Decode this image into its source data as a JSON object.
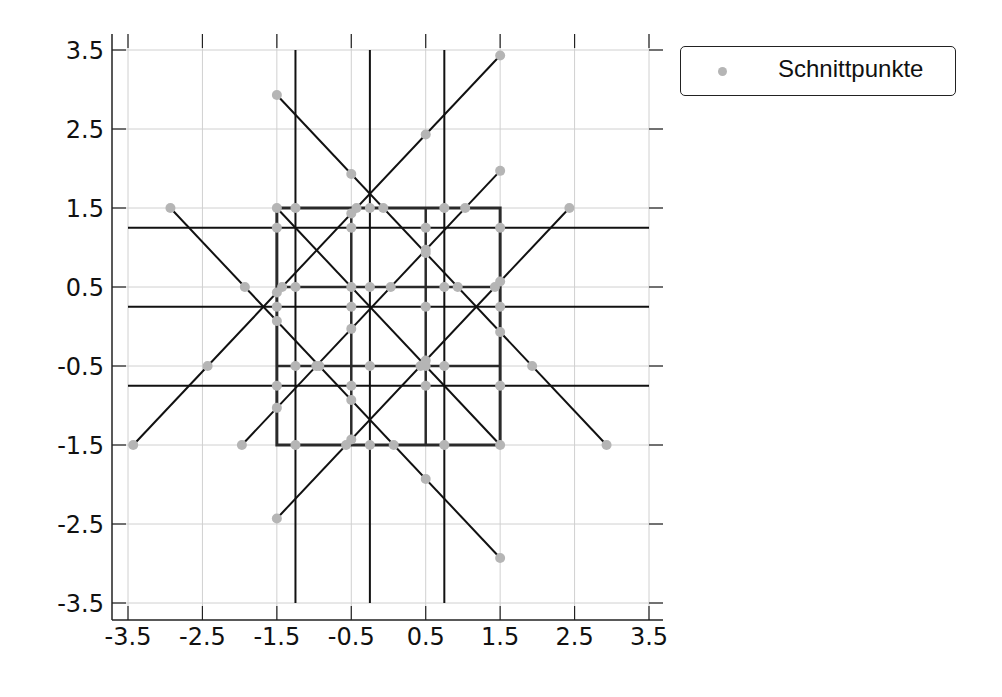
{
  "chart_data": {
    "type": "line+scatter",
    "title": "",
    "xlabel": "",
    "ylabel": "",
    "xlim": [
      -3.7,
      3.7
    ],
    "ylim": [
      -3.7,
      3.7
    ],
    "grid": true,
    "legend_position": "outside upper right",
    "xticks": [
      -3.5,
      -2.5,
      -1.5,
      -0.5,
      0.5,
      1.5,
      2.5,
      3.5
    ],
    "yticks": [
      -3.5,
      -2.5,
      -1.5,
      -0.5,
      0.5,
      1.5,
      2.5,
      3.5
    ],
    "xtick_labels": [
      "-3.5",
      "-2.5",
      "-1.5",
      "-0.5",
      "0.5",
      "1.5",
      "2.5",
      "3.5"
    ],
    "ytick_labels": [
      "-3.5",
      "-2.5",
      "-1.5",
      "-0.5",
      "0.5",
      "1.5",
      "2.5",
      "3.5"
    ],
    "colors": {
      "line": "#111111",
      "square": "#2a2a2a",
      "point": "#b5b5b5",
      "grid": "#d0d0d0"
    },
    "lines": {
      "horizontal": [
        {
          "y": 1.25,
          "x": [
            -3.5,
            3.5
          ]
        },
        {
          "y": 0.25,
          "x": [
            -3.5,
            3.5
          ]
        },
        {
          "y": -0.75,
          "x": [
            -3.5,
            3.5
          ]
        }
      ],
      "vertical": [
        {
          "x": -1.25,
          "y": [
            -3.5,
            3.5
          ]
        },
        {
          "x": -0.25,
          "y": [
            -3.5,
            3.5
          ]
        },
        {
          "x": 0.75,
          "y": [
            -3.5,
            3.5
          ]
        }
      ],
      "square_grid": {
        "outer": [
          -1.5,
          1.5
        ],
        "inner_x": [
          -0.5,
          0.5
        ],
        "inner_y": [
          -0.5,
          0.5
        ]
      },
      "diagonals": [
        {
          "from": [
            -3.43,
            -1.5
          ],
          "to": [
            1.5,
            3.43
          ]
        },
        {
          "from": [
            -1.97,
            -1.5
          ],
          "to": [
            1.5,
            1.97
          ]
        },
        {
          "from": [
            -1.5,
            -2.43
          ],
          "to": [
            2.43,
            1.5
          ]
        },
        {
          "from": [
            -1.5,
            2.93
          ],
          "to": [
            2.93,
            -1.5
          ]
        },
        {
          "from": [
            -1.5,
            1.5
          ],
          "to": [
            1.5,
            -1.5
          ]
        },
        {
          "from": [
            -2.93,
            1.5
          ],
          "to": [
            1.5,
            -2.93
          ]
        }
      ]
    },
    "series": [
      {
        "name": "Schnittpunkte",
        "type": "scatter",
        "points": [
          [
            -3.43,
            -1.5
          ],
          [
            -1.97,
            -1.5
          ],
          [
            -1.25,
            -1.5
          ],
          [
            -0.57,
            -1.5
          ],
          [
            -0.25,
            -1.5
          ],
          [
            0.07,
            -1.5
          ],
          [
            0.75,
            -1.5
          ],
          [
            1.5,
            -1.5
          ],
          [
            2.93,
            -1.5
          ],
          [
            -2.93,
            1.5
          ],
          [
            -1.5,
            1.5
          ],
          [
            -1.25,
            1.5
          ],
          [
            -0.43,
            1.5
          ],
          [
            -0.25,
            1.5
          ],
          [
            -0.07,
            1.5
          ],
          [
            0.75,
            1.5
          ],
          [
            1.03,
            1.5
          ],
          [
            2.43,
            1.5
          ],
          [
            -1.93,
            0.5
          ],
          [
            -1.43,
            0.5
          ],
          [
            -1.25,
            0.5
          ],
          [
            -0.5,
            0.5
          ],
          [
            -0.25,
            0.5
          ],
          [
            0.03,
            0.5
          ],
          [
            0.75,
            0.5
          ],
          [
            0.93,
            0.5
          ],
          [
            1.43,
            0.5
          ],
          [
            -2.43,
            -0.5
          ],
          [
            -1.25,
            -0.5
          ],
          [
            -0.97,
            -0.5
          ],
          [
            -0.93,
            -0.5
          ],
          [
            -0.25,
            -0.5
          ],
          [
            0.43,
            -0.5
          ],
          [
            0.5,
            -0.5
          ],
          [
            0.75,
            -0.5
          ],
          [
            1.93,
            -0.5
          ],
          [
            -1.5,
            2.93
          ],
          [
            -1.5,
            1.25
          ],
          [
            -1.5,
            0.43
          ],
          [
            -1.5,
            0.25
          ],
          [
            -1.5,
            0.07
          ],
          [
            -1.5,
            -0.75
          ],
          [
            -1.5,
            -1.03
          ],
          [
            -1.5,
            -2.43
          ],
          [
            -0.5,
            1.93
          ],
          [
            -0.5,
            1.43
          ],
          [
            -0.5,
            1.25
          ],
          [
            -0.5,
            0.25
          ],
          [
            -0.5,
            -0.03
          ],
          [
            -0.5,
            -0.75
          ],
          [
            -0.5,
            -0.93
          ],
          [
            -0.5,
            -1.43
          ],
          [
            0.5,
            2.43
          ],
          [
            0.5,
            1.25
          ],
          [
            0.5,
            0.97
          ],
          [
            0.5,
            0.93
          ],
          [
            0.5,
            0.25
          ],
          [
            0.5,
            -0.43
          ],
          [
            0.5,
            -0.75
          ],
          [
            0.5,
            -1.93
          ],
          [
            1.5,
            3.43
          ],
          [
            1.5,
            1.97
          ],
          [
            1.5,
            1.25
          ],
          [
            1.5,
            0.57
          ],
          [
            1.5,
            0.25
          ],
          [
            1.5,
            -0.07
          ],
          [
            1.5,
            -0.75
          ],
          [
            1.5,
            -2.93
          ]
        ]
      }
    ]
  },
  "legend": {
    "items": [
      {
        "label": "Schnittpunkte",
        "marker": "gray-dot"
      }
    ]
  }
}
